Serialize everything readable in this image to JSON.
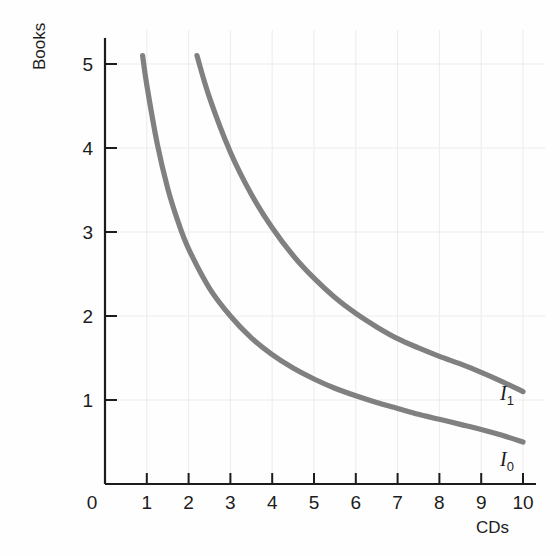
{
  "chart_data": {
    "type": "line",
    "title": "",
    "subtitle": "",
    "xlabel": "CDs",
    "ylabel": "Books",
    "xlim": [
      0,
      10.6
    ],
    "ylim": [
      0,
      5.6
    ],
    "grid": true,
    "grid_color": "#ececec",
    "axis_color": "#1c1c1c",
    "curve_color": "#808080",
    "background": "#fefefe",
    "legend_position": "inline-right-end",
    "x_ticks": [
      "0",
      "1",
      "2",
      "3",
      "4",
      "5",
      "6",
      "7",
      "8",
      "9",
      "10"
    ],
    "x_tick_values": [
      0,
      1,
      2,
      3,
      4,
      5,
      6,
      7,
      8,
      9,
      10
    ],
    "y_ticks": [
      "1",
      "2",
      "3",
      "4",
      "5"
    ],
    "y_tick_values": [
      1,
      2,
      3,
      4,
      5
    ],
    "series": [
      {
        "name": "I1",
        "label": "I",
        "subscript": "1",
        "description": "higher indifference curve",
        "x": [
          2.2,
          2.5,
          3.0,
          3.5,
          4.0,
          4.5,
          5.0,
          5.5,
          6.0,
          6.5,
          7.0,
          7.5,
          8.0,
          8.5,
          9.0,
          9.5,
          10.0
        ],
        "y": [
          5.1,
          4.6,
          3.95,
          3.45,
          3.05,
          2.72,
          2.45,
          2.22,
          2.03,
          1.87,
          1.73,
          1.62,
          1.52,
          1.43,
          1.33,
          1.22,
          1.1
        ]
      },
      {
        "name": "I0",
        "label": "I",
        "subscript": "0",
        "description": "lower indifference curve",
        "x": [
          0.9,
          1.0,
          1.25,
          1.5,
          1.75,
          2.0,
          2.5,
          3.0,
          3.5,
          4.0,
          4.5,
          5.0,
          5.5,
          6.0,
          6.5,
          7.0,
          7.5,
          8.0,
          8.5,
          9.0,
          9.5,
          10.0
        ],
        "y": [
          5.1,
          4.75,
          4.05,
          3.52,
          3.12,
          2.8,
          2.33,
          2.0,
          1.74,
          1.54,
          1.38,
          1.25,
          1.14,
          1.05,
          0.97,
          0.9,
          0.83,
          0.77,
          0.71,
          0.65,
          0.58,
          0.5
        ]
      }
    ],
    "annotations": [
      {
        "text": "I1",
        "x": 10.25,
        "y": 1.1
      },
      {
        "text": "I0",
        "x": 10.25,
        "y": 0.5
      }
    ]
  },
  "axes": {
    "y_title": "Books",
    "x_title": "CDs",
    "origin_label": "0"
  },
  "curves": {
    "upper": {
      "main": "I",
      "sub": "1"
    },
    "lower": {
      "main": "I",
      "sub": "0"
    }
  }
}
